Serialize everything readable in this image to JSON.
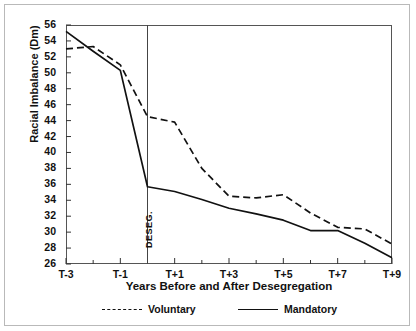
{
  "chart_data": {
    "type": "line",
    "title": "",
    "xlabel": "Years Before and After Desegregation",
    "ylabel": "Racial Imbalance (Dm)",
    "x": [
      -3,
      -2,
      -1,
      0,
      1,
      2,
      3,
      4,
      5,
      6,
      7,
      8,
      9
    ],
    "xtick_values": [
      -3,
      -1,
      1,
      3,
      5,
      7,
      9
    ],
    "xtick_labels": [
      "T-3",
      "T-1",
      "T+1",
      "T+3",
      "T+5",
      "T+7",
      "T+9"
    ],
    "xlim": [
      -3,
      9
    ],
    "ylim": [
      26,
      56
    ],
    "ytick_labels": [
      "26",
      "28",
      "30",
      "32",
      "34",
      "36",
      "38",
      "40",
      "42",
      "44",
      "46",
      "48",
      "50",
      "52",
      "54",
      "56"
    ],
    "ytick_values": [
      26,
      28,
      30,
      32,
      34,
      36,
      38,
      40,
      42,
      44,
      46,
      48,
      50,
      52,
      54,
      56
    ],
    "grid": false,
    "legend_position": "below-axis",
    "series": [
      {
        "name": "Voluntary",
        "style": "dashed",
        "color": "#111111",
        "values": [
          53.0,
          53.3,
          51.0,
          44.5,
          43.8,
          38.0,
          34.5,
          34.3,
          34.7,
          32.4,
          30.6,
          30.4,
          28.5
        ]
      },
      {
        "name": "Mandatory",
        "style": "solid",
        "color": "#111111",
        "values": [
          55.2,
          52.7,
          50.3,
          35.7,
          35.1,
          34.1,
          33.0,
          32.3,
          31.5,
          30.2,
          30.2,
          28.6,
          26.8
        ]
      }
    ],
    "annotations": [
      {
        "name": "desegregation-line",
        "type": "vline",
        "x": 0,
        "label": "DESEG."
      }
    ]
  },
  "legend": {
    "items": [
      {
        "label": "Voluntary",
        "style": "dashed"
      },
      {
        "label": "Mandatory",
        "style": "solid"
      }
    ]
  }
}
